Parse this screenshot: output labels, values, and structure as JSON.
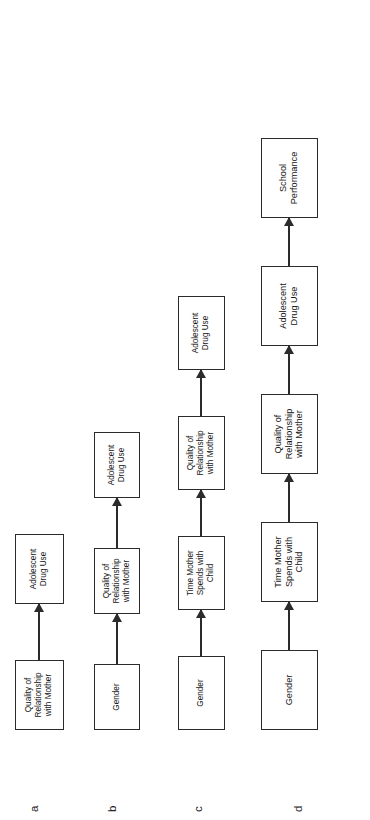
{
  "figure": {
    "type": "path-diagram-set",
    "rotation": "90-degrees-counterclockwise",
    "models": [
      {
        "label": "a",
        "nodes": [
          {
            "text": "Quality of\nRelationship\nwith Mother"
          },
          {
            "text": "Adolescent\nDrug Use"
          }
        ],
        "arrows": [
          {
            "from": "Quality of Relationship with Mother",
            "to": "Adolescent Drug Use"
          }
        ]
      },
      {
        "label": "b",
        "nodes": [
          {
            "text": "Gender"
          },
          {
            "text": "Quality of\nRelationship\nwith Mother"
          },
          {
            "text": "Adolescent\nDrug Use"
          }
        ],
        "arrows": [
          {
            "from": "Gender",
            "to": "Quality of Relationship with Mother"
          },
          {
            "from": "Quality of Relationship with Mother",
            "to": "Adolescent Drug Use"
          }
        ]
      },
      {
        "label": "c",
        "nodes": [
          {
            "text": "Gender"
          },
          {
            "text": "Time Mother\nSpends with\nChild"
          },
          {
            "text": "Quality of\nRelationship\nwith Mother"
          },
          {
            "text": "Adolescent\nDrug Use"
          }
        ],
        "arrows": [
          {
            "from": "Gender",
            "to": "Time Mother Spends with Child"
          },
          {
            "from": "Time Mother Spends with Child",
            "to": "Quality of Relationship with Mother"
          },
          {
            "from": "Quality of Relationship with Mother",
            "to": "Adolescent Drug Use"
          }
        ]
      },
      {
        "label": "d",
        "nodes": [
          {
            "text": "Gender"
          },
          {
            "text": "Time Mother\nSpends with\nChild"
          },
          {
            "text": "Quality of\nRelationship\nwith Mother"
          },
          {
            "text": "Adolescent\nDrug Use"
          },
          {
            "text": "School\nPerformance"
          }
        ],
        "arrows": [
          {
            "from": "Gender",
            "to": "Time Mother Spends with Child"
          },
          {
            "from": "Time Mother Spends with Child",
            "to": "Quality of Relationship with Mother"
          },
          {
            "from": "Quality of Relationship with Mother",
            "to": "Adolescent Drug Use"
          },
          {
            "from": "Adolescent Drug Use",
            "to": "School Performance"
          }
        ]
      }
    ],
    "colors": {
      "box_border": "#2b2b2b",
      "box_fill": "#ffffff",
      "arrow": "#2b2b2b",
      "text": "#161616",
      "background": "#ffffff"
    }
  }
}
